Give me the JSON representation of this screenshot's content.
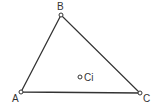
{
  "diagram": {
    "type": "triangle",
    "vertices": [
      {
        "id": "A",
        "label": "A",
        "x": 21,
        "y": 92,
        "label_x": 12,
        "label_y": 102
      },
      {
        "id": "B",
        "label": "B",
        "x": 61,
        "y": 15,
        "label_x": 57,
        "label_y": 10
      },
      {
        "id": "C",
        "label": "C",
        "x": 140,
        "y": 93,
        "label_x": 143,
        "label_y": 102
      }
    ],
    "interior_point": {
      "id": "Ci",
      "label": "Ci",
      "x": 80,
      "y": 77,
      "label_x": 84,
      "label_y": 81
    },
    "colors": {
      "line": "#333333",
      "point_fill": "#ffffff",
      "text": "#333333"
    }
  }
}
